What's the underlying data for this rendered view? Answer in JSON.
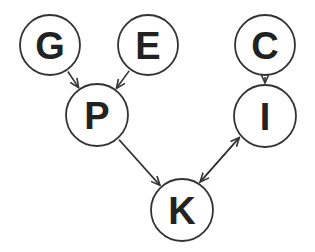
{
  "diagram": {
    "type": "directed-graph",
    "colors": {
      "stroke": "#333333",
      "text": "#222222",
      "background": "#ffffff"
    },
    "nodes": [
      {
        "id": "G",
        "label": "G",
        "cx": 50,
        "cy": 45,
        "r": 30
      },
      {
        "id": "E",
        "label": "E",
        "cx": 148,
        "cy": 45,
        "r": 30
      },
      {
        "id": "C",
        "label": "C",
        "cx": 265,
        "cy": 45,
        "r": 30
      },
      {
        "id": "P",
        "label": "P",
        "cx": 97,
        "cy": 115,
        "r": 31
      },
      {
        "id": "I",
        "label": "I",
        "cx": 265,
        "cy": 116,
        "r": 31
      },
      {
        "id": "K",
        "label": "K",
        "cx": 182,
        "cy": 210,
        "r": 31
      }
    ],
    "edges": [
      {
        "from": "G",
        "to": "P"
      },
      {
        "from": "E",
        "to": "P"
      },
      {
        "from": "C",
        "to": "I"
      },
      {
        "from": "P",
        "to": "K"
      },
      {
        "from": "I",
        "to": "K"
      },
      {
        "from": "K",
        "to": "I"
      }
    ]
  }
}
